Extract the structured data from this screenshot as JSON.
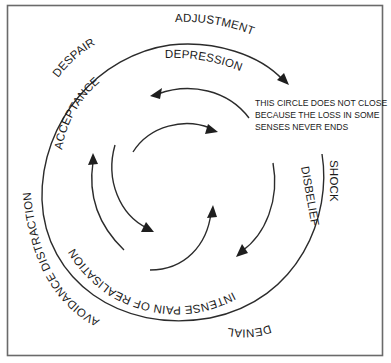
{
  "diagram": {
    "colors": {
      "frame": "#6a6a6a",
      "stroke": "#2b2b2b",
      "text": "#1a1a1a",
      "background": "#ffffff"
    },
    "outer_ring_labels": {
      "top": "ADJUSTMENT",
      "top_left": "DESPAIR",
      "left": "AVOIDANCE DISTRACTION",
      "bottom": "DENIAL",
      "right": "SHOCK"
    },
    "middle_ring_labels": {
      "top": "DEPRESSION",
      "top_left": "ACCEPTANCE",
      "bottom": "INTENSE PAIN OF REALISATION",
      "right": "DISBELIEF"
    },
    "note": {
      "lines": [
        "THIS CIRCLE DOES NOT CLOSE",
        "BECAUSE THE LOSS IN SOME",
        "SENSES NEVER ENDS"
      ]
    },
    "arrows": [
      {
        "ring": "outer",
        "direction": "clockwise",
        "end": "arrowhead-top-right"
      },
      {
        "ring": "middle",
        "segment": "top",
        "end": "arrowhead-left"
      },
      {
        "ring": "middle",
        "segment": "right",
        "end": "arrowhead-bottom-left"
      },
      {
        "ring": "middle",
        "segment": "left",
        "end": "arrowhead-up"
      },
      {
        "ring": "inner",
        "segment": "top",
        "end": "arrowhead-right"
      },
      {
        "ring": "inner",
        "segment": "left",
        "end": "arrowhead-down-right"
      },
      {
        "ring": "inner",
        "segment": "bottom",
        "end": "arrowhead-up"
      }
    ]
  }
}
